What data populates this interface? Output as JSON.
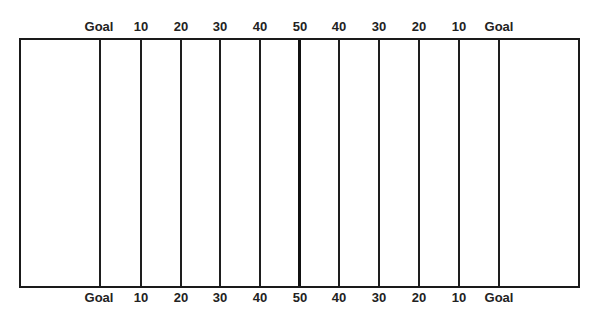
{
  "diagram": {
    "type": "football-field",
    "colors": {
      "lines": "#1e1e1e",
      "background": "#ffffff",
      "text": "#222222"
    },
    "yard_lines": [
      {
        "label": "Goal",
        "x": 99
      },
      {
        "label": "10",
        "x": 140
      },
      {
        "label": "20",
        "x": 180
      },
      {
        "label": "30",
        "x": 219
      },
      {
        "label": "40",
        "x": 259
      },
      {
        "label": "50",
        "x": 299
      },
      {
        "label": "40",
        "x": 338
      },
      {
        "label": "30",
        "x": 378
      },
      {
        "label": "20",
        "x": 418
      },
      {
        "label": "10",
        "x": 458
      },
      {
        "label": "Goal",
        "x": 498
      }
    ],
    "top_labels": [
      "Goal",
      "10",
      "20",
      "30",
      "40",
      "50",
      "40",
      "30",
      "20",
      "10",
      "Goal"
    ],
    "bottom_labels": [
      "Goal",
      "10",
      "20",
      "30",
      "40",
      "50",
      "40",
      "30",
      "20",
      "10",
      "Goal"
    ]
  }
}
